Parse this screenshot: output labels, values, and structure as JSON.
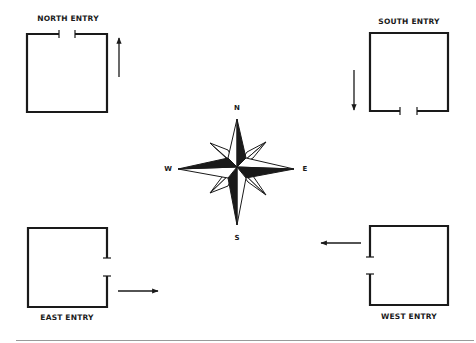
{
  "diagram": {
    "entries": [
      {
        "id": "north",
        "label": "NORTH ENTRY",
        "door_side": "top",
        "arrow_direction": "up"
      },
      {
        "id": "south",
        "label": "SOUTH ENTRY",
        "door_side": "bottom",
        "arrow_direction": "down"
      },
      {
        "id": "east",
        "label": "EAST ENTRY",
        "door_side": "right",
        "arrow_direction": "right"
      },
      {
        "id": "west",
        "label": "WEST ENTRY",
        "door_side": "left",
        "arrow_direction": "left"
      }
    ],
    "compass": {
      "north": "N",
      "south": "S",
      "east": "E",
      "west": "W"
    },
    "colors": {
      "line": "#1a1a1a",
      "background": "#ffffff",
      "divider": "#9a9a9a"
    }
  }
}
